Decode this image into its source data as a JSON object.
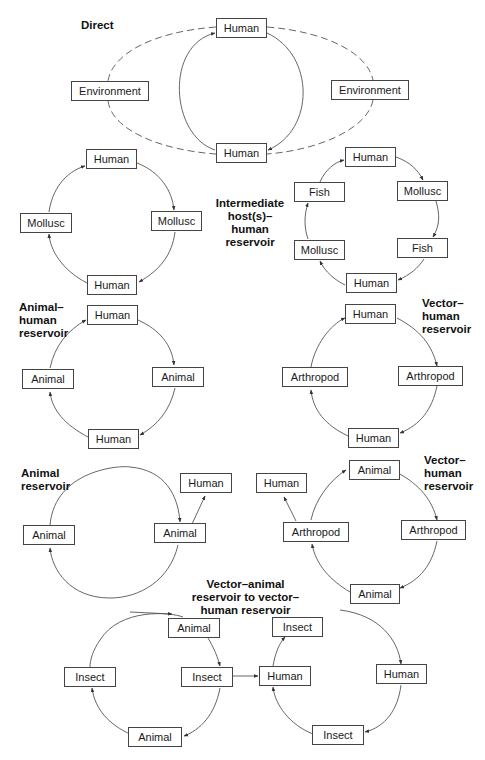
{
  "diagrams": [
    {
      "id": "direct",
      "title": "Direct",
      "nodes": [
        "Human",
        "Environment",
        "Environment",
        "Human"
      ]
    },
    {
      "id": "intermediate",
      "title": "Intermediate host(s)– human reservoir",
      "title_lines": [
        "Intermediate",
        "host(s)–",
        "human",
        "reservoir"
      ],
      "left_cycle": [
        "Human",
        "Mollusc",
        "Mollusc",
        "Human"
      ],
      "right_cycle": [
        "Human",
        "Mollusc",
        "Fish",
        "Human",
        "Mollusc",
        "Fish"
      ]
    },
    {
      "id": "animal-human",
      "title_lines": [
        "Animal–",
        "human",
        "reservoir"
      ],
      "nodes": [
        "Human",
        "Animal",
        "Human",
        "Animal"
      ]
    },
    {
      "id": "vector-human-1",
      "title_lines": [
        "Vector–",
        "human",
        "reservoir"
      ],
      "nodes": [
        "Human",
        "Arthropod",
        "Human",
        "Arthropod"
      ]
    },
    {
      "id": "animal-reservoir",
      "title_lines": [
        "Animal",
        "reservoir"
      ],
      "nodes": [
        "Animal",
        "Animal",
        "Human"
      ]
    },
    {
      "id": "vector-human-2",
      "title_lines": [
        "Vector–",
        "human",
        "reservoir"
      ],
      "nodes": [
        "Animal",
        "Arthropod",
        "Animal",
        "Arthropod",
        "Human"
      ]
    },
    {
      "id": "vector-animal-to-vector-human",
      "title_lines": [
        "Vector–animal",
        "reservoir to vector–",
        "human reservoir"
      ],
      "left_cycle": [
        "Animal",
        "Insect",
        "Animal",
        "Insect"
      ],
      "right_cycle": [
        "Insect",
        "Human",
        "Insect",
        "Human"
      ]
    }
  ]
}
